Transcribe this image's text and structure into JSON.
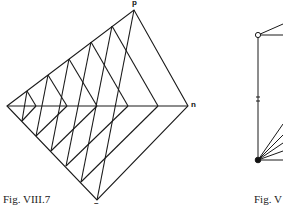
{
  "figure_left": {
    "caption": "Fig. VIII.7",
    "labels": {
      "top": "p",
      "right": "n",
      "bottom": "–"
    },
    "vertices": {
      "left": [
        7,
        106
      ],
      "top": [
        134,
        10
      ],
      "right": [
        188,
        106
      ],
      "bottom": [
        97,
        200
      ]
    }
  },
  "figure_right": {
    "caption": "Fig. V",
    "marker": "x"
  }
}
